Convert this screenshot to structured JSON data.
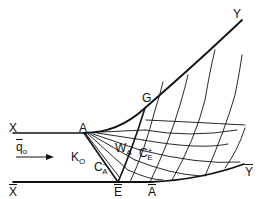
{
  "diagram": {
    "type": "characteristics-nozzle-flow",
    "labels": {
      "X": "X",
      "X_bar": "X",
      "Y": "Y",
      "Y_bar": "Y",
      "A": "A",
      "A_bar": "A",
      "G": "G",
      "E_bar": "E",
      "q0_main": "q",
      "q0_sub": "o",
      "K0_main": "K",
      "K0_sub": "O",
      "WA_main": "W",
      "WA_sub": "A",
      "CA_main": "C",
      "CA_sup": "−",
      "CA_sub": "A",
      "CE_main": "C",
      "CE_sup": "+",
      "CE_sub": "E"
    },
    "colors": {
      "line": "#111111",
      "background": "#ffffff"
    }
  }
}
